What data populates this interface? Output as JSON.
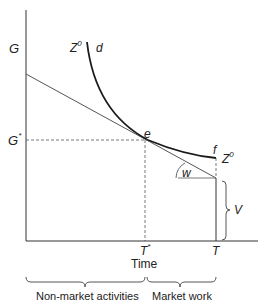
{
  "diagram": {
    "y_axis_labels": {
      "g": "G",
      "g_star": "G",
      "g_star_sup": "*"
    },
    "x_axis_labels": {
      "t_star": "T",
      "t_star_sup": "*",
      "t": "T",
      "axis_title": "Time"
    },
    "curve_labels": {
      "z0_left": "Z",
      "z0_left_sup": "0",
      "d": "d",
      "e": "e",
      "f": "f",
      "z0_right": "Z",
      "z0_right_sup": "0"
    },
    "annotations": {
      "w": "w",
      "v": "V"
    },
    "segments": {
      "non_market": "Non-market activities",
      "market": "Market work"
    },
    "colors": {
      "axis": "#333333",
      "curve": "#1a1a1a",
      "line": "#555555",
      "dashed": "#555555",
      "text": "#222222"
    }
  }
}
